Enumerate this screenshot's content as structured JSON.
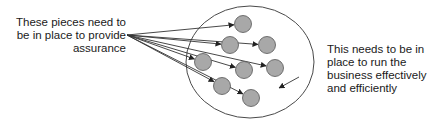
{
  "diagram": {
    "left_label": {
      "lines": [
        "These pieces need to",
        "be in place to provide",
        "assurance"
      ]
    },
    "right_label": {
      "lines": [
        "This needs to be in",
        "place to run the",
        "business effectively",
        "and efficiently"
      ]
    },
    "colors": {
      "outer_circle_stroke": "#4a4a4a",
      "piece_fill": "#a8a8a8",
      "piece_stroke": "#555555",
      "arrow": "#333333",
      "text": "#1a1a1a"
    },
    "outer_circle": {
      "cx": 250,
      "cy": 62,
      "rx": 64,
      "ry": 56
    },
    "arrow_origin": {
      "x": 127,
      "y": 35
    },
    "pieces": [
      {
        "cx": 243,
        "cy": 24
      },
      {
        "cx": 230,
        "cy": 45
      },
      {
        "cx": 267,
        "cy": 45
      },
      {
        "cx": 203,
        "cy": 62
      },
      {
        "cx": 244,
        "cy": 70
      },
      {
        "cx": 275,
        "cy": 68
      },
      {
        "cx": 222,
        "cy": 86
      },
      {
        "cx": 251,
        "cy": 98
      }
    ]
  }
}
